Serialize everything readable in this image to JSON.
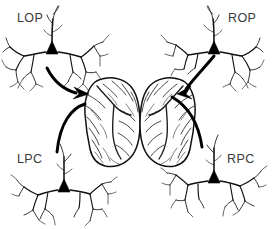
{
  "figure": {
    "background_color": "#ffffff",
    "ink_color": "#111111",
    "label_color": "#3a3a3a",
    "width": 276,
    "height": 229
  },
  "labels": {
    "top_left": "LOP",
    "top_right": "ROP",
    "bottom_left": "LPC",
    "bottom_right": "RPC"
  },
  "neurons": [
    {
      "id": "LOP",
      "label": "LOP",
      "position": "top-left",
      "soma_x": 51,
      "soma_y": 47,
      "label_x": 17,
      "label_y": 22,
      "type": "pyramidal-neuron"
    },
    {
      "id": "ROP",
      "label": "ROP",
      "position": "top-right",
      "soma_x": 213,
      "soma_y": 47,
      "label_x": 228,
      "label_y": 22,
      "type": "pyramidal-neuron"
    },
    {
      "id": "LPC",
      "label": "LPC",
      "position": "bottom-left",
      "soma_x": 63,
      "soma_y": 185,
      "label_x": 17,
      "label_y": 163,
      "type": "pyramidal-neuron"
    },
    {
      "id": "RPC",
      "label": "RPC",
      "position": "bottom-right",
      "soma_x": 213,
      "soma_y": 176,
      "label_x": 227,
      "label_y": 163,
      "type": "pyramidal-neuron"
    }
  ],
  "brains": [
    {
      "id": "left-hemisphere",
      "name": "left-brain-hemisphere",
      "center_x": 112,
      "center_y": 122,
      "view": "lateral"
    },
    {
      "id": "right-hemisphere",
      "name": "right-brain-hemisphere",
      "center_x": 168,
      "center_y": 122,
      "view": "lateral"
    }
  ],
  "connections": [
    {
      "id": "lop-to-left-brain",
      "from": "LOP",
      "to": "left-hemisphere",
      "direction": "neuron-to-brain",
      "has_arrowhead": true
    },
    {
      "id": "left-brain-to-lpc",
      "from": "left-hemisphere",
      "to": "LPC",
      "direction": "brain-to-neuron",
      "has_arrowhead": false
    },
    {
      "id": "rop-to-right-brain",
      "from": "ROP",
      "to": "right-hemisphere",
      "direction": "neuron-to-brain",
      "has_arrowhead": true
    },
    {
      "id": "right-brain-to-rpc",
      "from": "right-hemisphere",
      "to": "RPC",
      "direction": "brain-to-neuron",
      "has_arrowhead": false
    }
  ]
}
